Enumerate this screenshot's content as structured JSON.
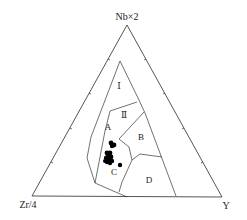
{
  "diagram": {
    "type": "ternary",
    "vertices": {
      "top": {
        "label": "Nb×2"
      },
      "left": {
        "label": "Zr/4"
      },
      "right": {
        "label": "Y"
      }
    },
    "fields": [
      {
        "id": "I",
        "label": "Ⅰ"
      },
      {
        "id": "II",
        "label": "Ⅱ"
      },
      {
        "id": "A",
        "label": "A"
      },
      {
        "id": "B",
        "label": "B"
      },
      {
        "id": "C",
        "label": "C"
      },
      {
        "id": "D",
        "label": "D"
      }
    ],
    "sample_count": 14
  },
  "colors": {
    "lines": "#2a2a2a",
    "points": "#000000",
    "background": "#ffffff"
  }
}
